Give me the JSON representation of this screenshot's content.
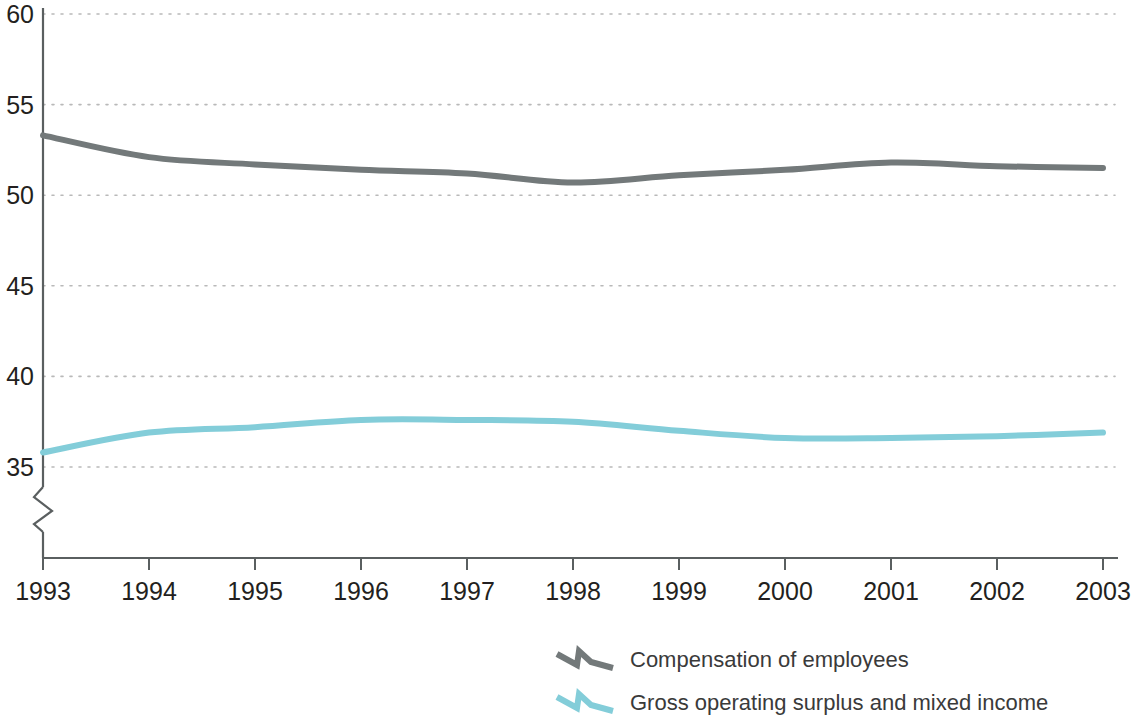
{
  "chart_data": {
    "type": "line",
    "title": "",
    "subtitle": "",
    "xlabel": "",
    "ylabel": "",
    "x": [
      1993,
      1994,
      1995,
      1996,
      1997,
      1998,
      1999,
      2000,
      2001,
      2002,
      2003
    ],
    "x_tick_labels": [
      "1993",
      "1994",
      "1995",
      "1996",
      "1997",
      "1998",
      "1999",
      "2000",
      "2001",
      "2002",
      "2003"
    ],
    "y_tick_labels": [
      "60",
      "55",
      "50",
      "45",
      "40",
      "35"
    ],
    "y_ticks": [
      60,
      55,
      50,
      45,
      40,
      35
    ],
    "ylim": [
      35,
      60
    ],
    "xlim": [
      1993,
      2003
    ],
    "grid": "horizontal-dotted",
    "y_axis_break": true,
    "legend_position": "bottom-center",
    "series": [
      {
        "name": "Compensation of employees",
        "color": "#73797a",
        "values": [
          53.3,
          52.1,
          51.7,
          51.4,
          51.2,
          50.7,
          51.1,
          51.4,
          51.8,
          51.6,
          51.5
        ]
      },
      {
        "name": "Gross operating surplus and mixed income",
        "color": "#83cdd9",
        "values": [
          35.8,
          36.9,
          37.2,
          37.6,
          37.6,
          37.5,
          37.0,
          36.6,
          36.6,
          36.7,
          36.9
        ]
      }
    ]
  },
  "legend": {
    "items": [
      {
        "label": "Compensation of employees",
        "color": "#73797a",
        "marker": "zigzag-line-icon"
      },
      {
        "label": "Gross operating surplus and mixed income",
        "color": "#83cdd9",
        "marker": "zigzag-line-icon"
      }
    ]
  },
  "colors": {
    "axis": "#5a5f60",
    "grid": "#b9b9b9",
    "text": "#231f20",
    "legend_text": "#3a3a3a",
    "background": "#ffffff"
  }
}
